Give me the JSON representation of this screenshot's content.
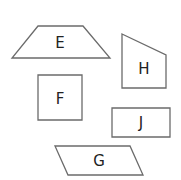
{
  "diagram": {
    "title": "",
    "stroke_color": "#6b6b6b",
    "label_color": "#222222",
    "shapes": [
      {
        "id": "E",
        "label": "E",
        "kind": "trapezoid",
        "points": "38,26 83,26 110,58 12,58",
        "label_pos": [
          60,
          43
        ]
      },
      {
        "id": "H",
        "label": "H",
        "kind": "right-trapezoid",
        "points": "122,34 166,55 166,88 122,88",
        "label_pos": [
          144,
          69
        ]
      },
      {
        "id": "F",
        "label": "F",
        "kind": "square",
        "points": "38,75 82,75 82,120 38,120",
        "label_pos": [
          60,
          99
        ]
      },
      {
        "id": "J",
        "label": "J",
        "kind": "rectangle",
        "points": "112,108 170,108 170,137 112,137",
        "label_pos": [
          141,
          123
        ]
      },
      {
        "id": "G",
        "label": "G",
        "kind": "parallelogram",
        "points": "55,146 130,146 143,175 68,175",
        "label_pos": [
          99,
          161
        ]
      }
    ]
  }
}
